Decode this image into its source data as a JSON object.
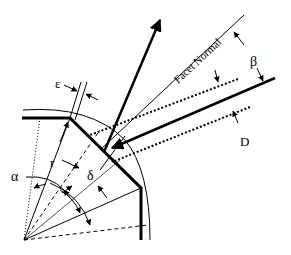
{
  "diagram": {
    "labels": {
      "facet_normal": "Facet Normal",
      "beta": "β",
      "epsilon": "ε",
      "r": "r",
      "alpha": "α",
      "delta": "δ",
      "D": "D"
    },
    "colors": {
      "stroke": "#000000",
      "background": "#ffffff"
    }
  }
}
